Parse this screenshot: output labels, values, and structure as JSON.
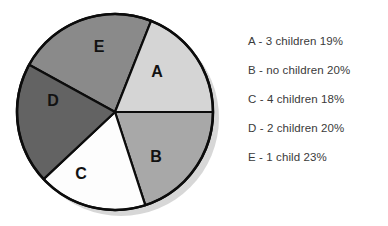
{
  "chart_data": {
    "type": "pie",
    "title": "",
    "categories": [
      "A",
      "B",
      "C",
      "D",
      "E"
    ],
    "values": [
      19,
      20,
      18,
      20,
      23
    ],
    "unit": "%",
    "labels": [
      "A",
      "B",
      "C",
      "D",
      "E"
    ],
    "legend_position": "right",
    "grid": false,
    "slices": [
      {
        "key": "A",
        "label": "A",
        "description": "3 children",
        "value": 19,
        "value_text": "19%",
        "legend_text": "A - 3 children 19%",
        "color": "#d5d5d5",
        "start_angle": 0,
        "end_angle": 68.4
      },
      {
        "key": "B",
        "label": "B",
        "description": "no children",
        "value": 20,
        "value_text": "20%",
        "legend_text": "B - no children 20%",
        "color": "#a8a8a8",
        "start_angle": 288,
        "end_angle": 360
      },
      {
        "key": "C",
        "label": "C",
        "description": "4 children",
        "value": 18,
        "value_text": "18%",
        "legend_text": "C - 4 children 18%",
        "color": "#fdfdfd",
        "start_angle": 223.2,
        "end_angle": 288
      },
      {
        "key": "D",
        "label": "D",
        "description": "2 children",
        "value": 20,
        "value_text": "20%",
        "legend_text": "D - 2 children 20%",
        "color": "#636363",
        "start_angle": 151.2,
        "end_angle": 223.2
      },
      {
        "key": "E",
        "label": "E",
        "description": "1 child",
        "value": 23,
        "value_text": "23%",
        "legend_text": "E - 1 child 23%",
        "color": "#8a8a8a",
        "start_angle": 68.4,
        "end_angle": 151.2
      }
    ]
  },
  "legend": {
    "rows": [
      {
        "text": "A - 3 children 19%"
      },
      {
        "text": "B - no children 20%"
      },
      {
        "text": "C - 4 children 18%"
      },
      {
        "text": "D - 2 children 20%"
      },
      {
        "text": "E - 1 child 23%"
      }
    ]
  },
  "colors": {
    "background": "#ffffff",
    "outline": "#0c0c0c",
    "shadow": "#c9c9c9",
    "slice_a": "#d5d5d5",
    "slice_b": "#a8a8a8",
    "slice_c": "#fdfdfd",
    "slice_d": "#636363",
    "slice_e": "#8a8a8a",
    "label_text": "#121212",
    "legend_text": "#3a3a3a"
  }
}
